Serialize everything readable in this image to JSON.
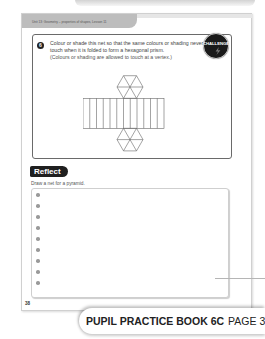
{
  "page": {
    "header": "Unit 13: Geometry – properties of shapes, Lesson 11",
    "page_number": "38"
  },
  "question": {
    "number": "6",
    "text": "Colour or shade this net so that the same colours or shading never touch when it is folded to form a hexagonal prism.",
    "note": "(Colours or shading are allowed to touch at a vertex.)",
    "badge": "CHALLENGE",
    "net": {
      "shape": "hexagonal-prism-net",
      "rectangle_strips": 12,
      "hexagon_count": 2
    }
  },
  "reflect": {
    "title": "Reflect",
    "prompt": "Draw a net for a pyramid.",
    "bullet_count": 9
  },
  "footer": {
    "book": "PUPIL PRACTICE BOOK 6C",
    "page": "PAGE 38"
  },
  "colors": {
    "header_gray": "#bdbdbd",
    "badge_dark": "#1f1f1f",
    "bullet_gray": "#9a9a9a"
  }
}
